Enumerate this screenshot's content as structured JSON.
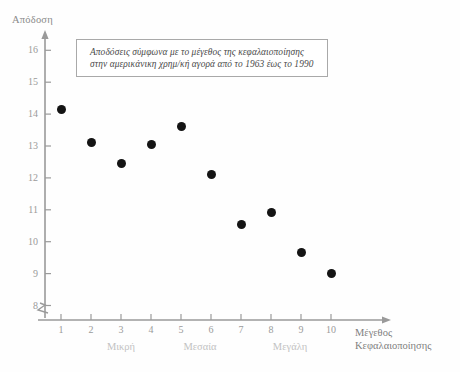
{
  "axes": {
    "y_title": "Απόδοση",
    "x_title_line1": "Μέγεθος",
    "x_title_line2": "Κεφαλαιοποίησης"
  },
  "title_box": {
    "line1": "Αποδόσεις σύμφωνα με το μέγεθος της κεφαλαιοποίησης",
    "line2": "στην αμερικάνικη χρημ/κή αγορά από το 1963 έως το 1990"
  },
  "category_labels": [
    {
      "text": "Μικρή",
      "x": 3
    },
    {
      "text": "Μεσαία",
      "x": 5.5
    },
    {
      "text": "Μεγάλη",
      "x": 8.5
    }
  ],
  "yticks": [
    "8",
    "9",
    "10",
    "11",
    "12",
    "13",
    "14",
    "15",
    "16"
  ],
  "xticks": [
    "1",
    "2",
    "3",
    "4",
    "5",
    "6",
    "7",
    "8",
    "9",
    "10"
  ],
  "colors": {
    "marker": "#141414",
    "axis": "#9a9a9a",
    "title_box_border": "#a9a9a9",
    "tick_text": "#9a9a9a",
    "category_text": "#c2c2c2",
    "background": "#fefefe"
  },
  "chart_data": {
    "type": "scatter",
    "title": "Αποδόσεις σύμφωνα με το μέγεθος της κεφαλαιοποίησης στην αμερικάνικη χρημ/κή αγορά από το 1963 έως το 1990",
    "xlabel": "Μέγεθος Κεφαλαιοποίησης",
    "ylabel": "Απόδοση",
    "x": [
      1,
      2,
      3,
      4,
      5,
      6,
      7,
      8,
      9,
      10
    ],
    "values": [
      14.15,
      13.1,
      12.45,
      13.05,
      13.6,
      12.1,
      10.55,
      10.9,
      9.65,
      9.0
    ],
    "xlim": [
      0,
      10.8
    ],
    "ylim": [
      8,
      16.4
    ],
    "xticks": [
      1,
      2,
      3,
      4,
      5,
      6,
      7,
      8,
      9,
      10
    ],
    "yticks": [
      8,
      9,
      10,
      11,
      12,
      13,
      14,
      15,
      16
    ],
    "y_axis_break": true,
    "grid": false,
    "legend": "none",
    "group_bands": [
      {
        "label": "Μικρή",
        "x_range": [
          1,
          3
        ]
      },
      {
        "label": "Μεσαία",
        "x_range": [
          4,
          7
        ]
      },
      {
        "label": "Μεγάλη",
        "x_range": [
          8,
          10
        ]
      }
    ]
  }
}
